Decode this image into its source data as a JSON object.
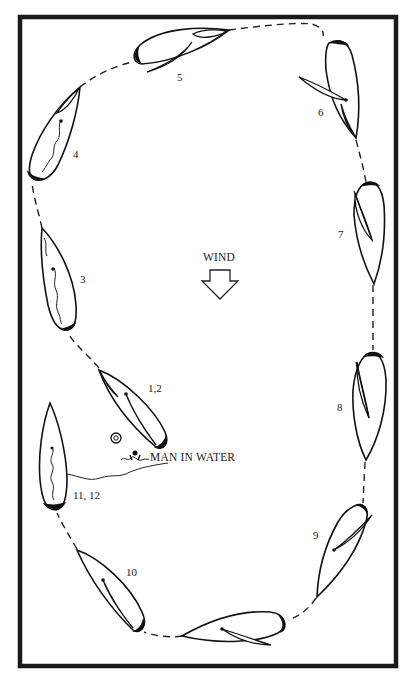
{
  "diagram": {
    "wind_label": "WIND",
    "wind_direction": "down",
    "man_in_water_label": "MAN IN WATER",
    "boats": [
      {
        "id": "b12",
        "label": "1,2"
      },
      {
        "id": "b3",
        "label": "3"
      },
      {
        "id": "b4",
        "label": "4"
      },
      {
        "id": "b5",
        "label": "5"
      },
      {
        "id": "b6",
        "label": "6"
      },
      {
        "id": "b7",
        "label": "7"
      },
      {
        "id": "b8",
        "label": "8"
      },
      {
        "id": "b9",
        "label": "9"
      },
      {
        "id": "bottom",
        "label": ""
      },
      {
        "id": "b10",
        "label": "10"
      },
      {
        "id": "b1112",
        "label": "11, 12"
      }
    ],
    "colors": {
      "ink": "#111111",
      "paper": "#ffffff"
    }
  }
}
